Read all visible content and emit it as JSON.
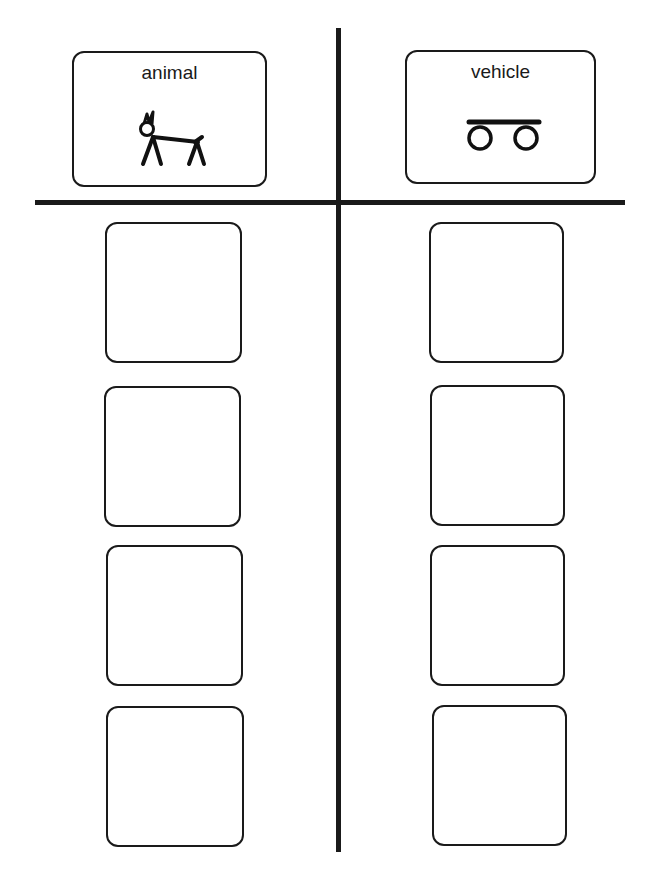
{
  "worksheet": {
    "type": "picture sort",
    "categories": [
      {
        "label": "animal",
        "icon": "dog-stick-figure-icon",
        "slots": 4
      },
      {
        "label": "vehicle",
        "icon": "cart-wheels-icon",
        "slots": 4
      }
    ],
    "footer_text": ""
  },
  "colors": {
    "ink": "#1a1a1a",
    "background": "#ffffff"
  }
}
